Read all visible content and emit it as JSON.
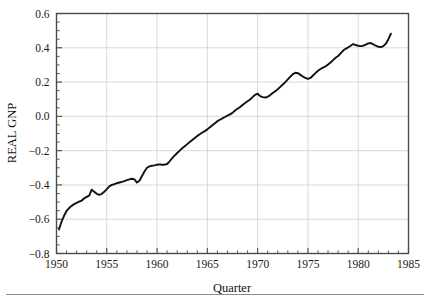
{
  "chart_data": {
    "type": "line",
    "title": "",
    "xlabel": "Quarter",
    "ylabel": "REAL GNP",
    "xlim": [
      1950,
      1985
    ],
    "ylim": [
      -0.8,
      0.6
    ],
    "grid": true,
    "legend": null,
    "x_ticks": [
      1950,
      1955,
      1960,
      1965,
      1970,
      1975,
      1980,
      1985
    ],
    "x_tick_labels": [
      "1950",
      "1955",
      "1960",
      "1965",
      "1970",
      "1975",
      "1980",
      "1985"
    ],
    "x_minor_step": 1,
    "y_ticks": [
      -0.8,
      -0.6,
      -0.4,
      -0.2,
      0.0,
      0.2,
      0.4,
      0.6
    ],
    "y_tick_labels": [
      "−0.8",
      "−0.6",
      "−0.4",
      "−0.2",
      "0.0",
      "0.2",
      "0.4",
      "0.6"
    ],
    "y_minor_step": 0.05,
    "line_color": "#111111",
    "grid_color": "#cfcfcf",
    "frame_color": "#4a4a4a",
    "series": [
      {
        "name": "REAL GNP",
        "x": [
          1950.25,
          1950.5,
          1950.75,
          1951.0,
          1951.25,
          1951.5,
          1951.75,
          1952.0,
          1952.25,
          1952.5,
          1952.75,
          1953.0,
          1953.25,
          1953.5,
          1953.75,
          1954.0,
          1954.25,
          1954.5,
          1954.75,
          1955.0,
          1955.25,
          1955.5,
          1955.75,
          1956.0,
          1956.25,
          1956.5,
          1956.75,
          1957.0,
          1957.25,
          1957.5,
          1957.75,
          1958.0,
          1958.25,
          1958.5,
          1958.75,
          1959.0,
          1959.25,
          1959.5,
          1959.75,
          1960.0,
          1960.25,
          1960.5,
          1960.75,
          1961.0,
          1961.25,
          1961.5,
          1961.75,
          1962.0,
          1962.25,
          1962.5,
          1962.75,
          1963.0,
          1963.25,
          1963.5,
          1963.75,
          1964.0,
          1964.25,
          1964.5,
          1964.75,
          1965.0,
          1965.25,
          1965.5,
          1965.75,
          1966.0,
          1966.25,
          1966.5,
          1966.75,
          1967.0,
          1967.25,
          1967.5,
          1967.75,
          1968.0,
          1968.25,
          1968.5,
          1968.75,
          1969.0,
          1969.25,
          1969.5,
          1969.75,
          1970.0,
          1970.25,
          1970.5,
          1970.75,
          1971.0,
          1971.25,
          1971.5,
          1971.75,
          1972.0,
          1972.25,
          1972.5,
          1972.75,
          1973.0,
          1973.25,
          1973.5,
          1973.75,
          1974.0,
          1974.25,
          1974.5,
          1974.75,
          1975.0,
          1975.25,
          1975.5,
          1975.75,
          1976.0,
          1976.25,
          1976.5,
          1976.75,
          1977.0,
          1977.25,
          1977.5,
          1977.75,
          1978.0,
          1978.25,
          1978.5,
          1978.75,
          1979.0,
          1979.25,
          1979.5,
          1979.75,
          1980.0,
          1980.25,
          1980.5,
          1980.75,
          1981.0,
          1981.25,
          1981.5,
          1981.75,
          1982.0,
          1982.25,
          1982.5,
          1982.75,
          1983.0,
          1983.25
        ],
        "y": [
          -0.66,
          -0.615,
          -0.58,
          -0.552,
          -0.535,
          -0.522,
          -0.512,
          -0.505,
          -0.498,
          -0.492,
          -0.478,
          -0.47,
          -0.462,
          -0.428,
          -0.44,
          -0.452,
          -0.458,
          -0.452,
          -0.44,
          -0.424,
          -0.408,
          -0.4,
          -0.396,
          -0.39,
          -0.386,
          -0.382,
          -0.378,
          -0.372,
          -0.368,
          -0.364,
          -0.368,
          -0.386,
          -0.376,
          -0.348,
          -0.322,
          -0.3,
          -0.292,
          -0.288,
          -0.286,
          -0.282,
          -0.28,
          -0.282,
          -0.282,
          -0.278,
          -0.262,
          -0.244,
          -0.228,
          -0.214,
          -0.2,
          -0.186,
          -0.174,
          -0.162,
          -0.15,
          -0.138,
          -0.126,
          -0.114,
          -0.104,
          -0.094,
          -0.086,
          -0.076,
          -0.064,
          -0.052,
          -0.04,
          -0.028,
          -0.02,
          -0.012,
          -0.004,
          0.004,
          0.012,
          0.02,
          0.034,
          0.044,
          0.054,
          0.066,
          0.078,
          0.088,
          0.098,
          0.112,
          0.126,
          0.132,
          0.118,
          0.112,
          0.11,
          0.114,
          0.124,
          0.136,
          0.146,
          0.158,
          0.172,
          0.186,
          0.2,
          0.216,
          0.232,
          0.246,
          0.254,
          0.252,
          0.242,
          0.232,
          0.224,
          0.218,
          0.224,
          0.238,
          0.252,
          0.266,
          0.276,
          0.284,
          0.292,
          0.302,
          0.314,
          0.328,
          0.342,
          0.352,
          0.368,
          0.384,
          0.394,
          0.402,
          0.412,
          0.422,
          0.416,
          0.412,
          0.41,
          0.412,
          0.418,
          0.426,
          0.428,
          0.42,
          0.412,
          0.406,
          0.404,
          0.41,
          0.424,
          0.45,
          0.482
        ]
      }
    ]
  },
  "axes": {
    "x_axis_title": "Quarter",
    "y_axis_title": "REAL GNP"
  }
}
